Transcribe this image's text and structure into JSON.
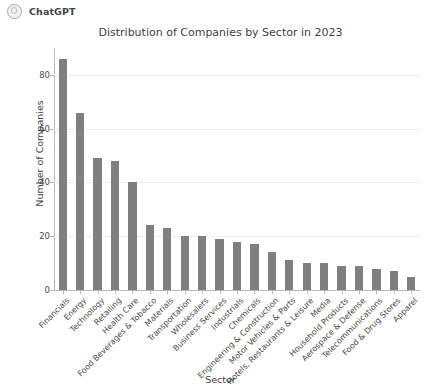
{
  "header": {
    "brand": "ChatGPT",
    "logo_icon": "chatgpt-logo-icon"
  },
  "chart_data": {
    "type": "bar",
    "title": "Distribution of Companies by Sector in 2023",
    "xlabel": "Sector",
    "ylabel": "Number of Companies",
    "ylim": [
      0,
      90
    ],
    "yticks": [
      0,
      20,
      40,
      60,
      80
    ],
    "ytick_labels": [
      "0",
      "20",
      "40",
      "60",
      "80"
    ],
    "grid": true,
    "legend": false,
    "bar_color": "#7f7f7f",
    "categories": [
      "Financials",
      "Energy",
      "Technology",
      "Retailing",
      "Health Care",
      "Food Beverages & Tobacco",
      "Materials",
      "Transportation",
      "Wholesalers",
      "Business Services",
      "Industrials",
      "Chemicals",
      "Engineering & Construction",
      "Motor Vehicles & Parts",
      "Hotels, Restaurants & Leisure",
      "Media",
      "Household Products",
      "Aerospace & Defense",
      "Telecommunications",
      "Food & Drug Stores",
      "Apparel"
    ],
    "values": [
      86,
      66,
      49,
      48,
      40,
      24,
      23,
      20,
      20,
      19,
      18,
      17,
      14,
      11,
      10,
      10,
      9,
      9,
      8,
      7,
      5
    ]
  }
}
